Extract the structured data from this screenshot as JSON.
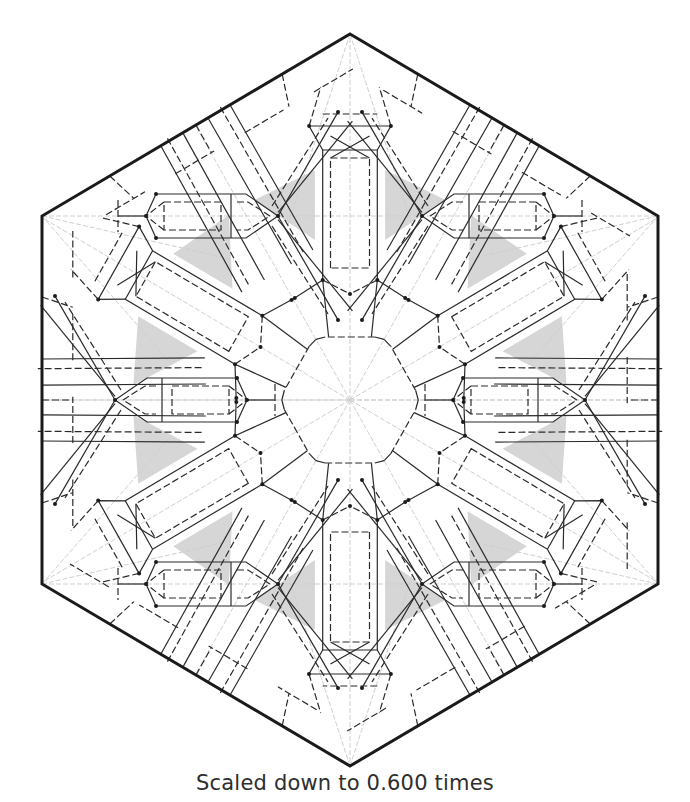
{
  "figure": {
    "type": "origami-crease-pattern",
    "shape": "hexagon",
    "symmetry": "6-fold",
    "hexagon_vertices": [
      [
        350,
        34
      ],
      [
        658,
        216
      ],
      [
        658,
        584
      ],
      [
        350,
        766
      ],
      [
        42,
        584
      ],
      [
        42,
        216
      ]
    ],
    "center": [
      350,
      400
    ],
    "colors": {
      "border": "#1a1a1a",
      "crease": "#2a2a2a",
      "guide": "#cfcfcf",
      "shade": "#d6d6d6",
      "background": "#ffffff"
    },
    "legend": {
      "solid_line": "mountain fold",
      "dashed_line": "valley fold",
      "light_gray_line": "reference crease",
      "gray_fill": "shaded region"
    }
  },
  "caption": {
    "text": "Scaled down to 0.600 times"
  }
}
